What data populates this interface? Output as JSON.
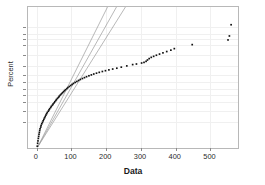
{
  "chart_data": {
    "type": "scatter",
    "title": "",
    "xlabel": "Data",
    "ylabel": "Percent",
    "xlim": [
      -25,
      585
    ],
    "ylim_percent": [
      1.0,
      99.9
    ],
    "grid": true,
    "legend": null,
    "x_ticks": [
      0,
      100,
      200,
      300,
      400,
      500
    ],
    "x_tick_labels": [
      "0",
      "100",
      "200",
      "300",
      "400",
      "500"
    ],
    "y_ticks_percent": [
      99,
      98,
      97,
      95,
      90,
      80,
      70,
      60,
      50,
      40,
      30,
      20,
      10
    ],
    "y_tick_labels": [
      "99",
      "98",
      "97",
      "95",
      "90",
      "80",
      "70",
      "60",
      "50",
      "40",
      "30",
      "20",
      "10"
    ],
    "series": [
      {
        "name": "data-points",
        "marker": "square",
        "color": "#111111",
        "points": [
          [
            2,
            1.2
          ],
          [
            3,
            1.6
          ],
          [
            4,
            2.0
          ],
          [
            5,
            2.5
          ],
          [
            6,
            3.0
          ],
          [
            7,
            3.6
          ],
          [
            8,
            4.2
          ],
          [
            9,
            4.9
          ],
          [
            10,
            5.6
          ],
          [
            12,
            6.4
          ],
          [
            13,
            7.2
          ],
          [
            15,
            8.1
          ],
          [
            17,
            9.0
          ],
          [
            19,
            10.0
          ],
          [
            21,
            11.0
          ],
          [
            23,
            12.1
          ],
          [
            25,
            13.2
          ],
          [
            27,
            14.4
          ],
          [
            29,
            15.6
          ],
          [
            31,
            16.8
          ],
          [
            34,
            18.1
          ],
          [
            36,
            19.4
          ],
          [
            38,
            20.7
          ],
          [
            41,
            22.1
          ],
          [
            43,
            23.5
          ],
          [
            46,
            24.9
          ],
          [
            48,
            26.3
          ],
          [
            51,
            27.8
          ],
          [
            53,
            29.3
          ],
          [
            56,
            30.8
          ],
          [
            58,
            32.3
          ],
          [
            61,
            33.9
          ],
          [
            64,
            35.4
          ],
          [
            66,
            37.0
          ],
          [
            69,
            38.6
          ],
          [
            72,
            40.2
          ],
          [
            75,
            41.8
          ],
          [
            78,
            43.4
          ],
          [
            81,
            45.0
          ],
          [
            84,
            46.6
          ],
          [
            88,
            48.2
          ],
          [
            91,
            49.8
          ],
          [
            95,
            51.4
          ],
          [
            99,
            53.0
          ],
          [
            103,
            54.6
          ],
          [
            107,
            56.1
          ],
          [
            112,
            57.6
          ],
          [
            117,
            59.1
          ],
          [
            122,
            60.6
          ],
          [
            127,
            62.0
          ],
          [
            133,
            63.4
          ],
          [
            139,
            64.7
          ],
          [
            145,
            66.0
          ],
          [
            152,
            67.3
          ],
          [
            159,
            68.5
          ],
          [
            166,
            69.7
          ],
          [
            174,
            70.8
          ],
          [
            182,
            71.9
          ],
          [
            191,
            73.0
          ],
          [
            200,
            74.0
          ],
          [
            210,
            75.0
          ],
          [
            221,
            76.0
          ],
          [
            233,
            77.0
          ],
          [
            246,
            78.2
          ],
          [
            262,
            79.6
          ],
          [
            279,
            81.0
          ],
          [
            290,
            81.6
          ],
          [
            305,
            82.6
          ],
          [
            312,
            83.2
          ],
          [
            318,
            84.2
          ],
          [
            322,
            85.4
          ],
          [
            327,
            86.6
          ],
          [
            333,
            87.6
          ],
          [
            340,
            88.4
          ],
          [
            348,
            89.2
          ],
          [
            357,
            90.0
          ],
          [
            367,
            90.8
          ],
          [
            378,
            91.6
          ],
          [
            390,
            92.4
          ],
          [
            400,
            93.2
          ],
          [
            452,
            95.0
          ],
          [
            556,
            96.6
          ],
          [
            560,
            97.6
          ],
          [
            565,
            99.2
          ]
        ]
      }
    ],
    "reference_lines": [
      {
        "name": "fit-line",
        "color": "#9a9a9a",
        "x1": 3,
        "y1": 1.1,
        "x2": 232,
        "y2": 99.9
      },
      {
        "name": "lower-ci-bound",
        "color": "#9a9a9a",
        "x1": 3,
        "y1": 1.1,
        "x2": 206,
        "y2": 99.9
      },
      {
        "name": "upper-ci-bound",
        "color": "#9a9a9a",
        "x1": 3,
        "y1": 1.1,
        "x2": 258,
        "y2": 99.9
      }
    ]
  },
  "axes": {
    "x_title": "Data",
    "y_title": "Percent"
  }
}
